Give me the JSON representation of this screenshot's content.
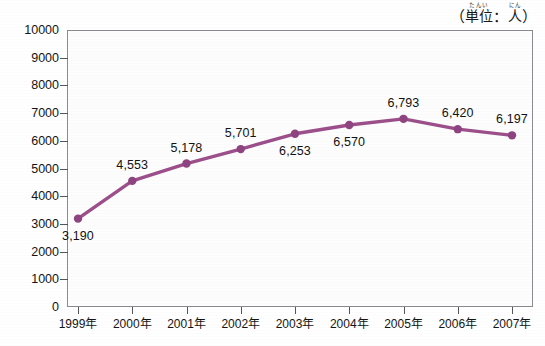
{
  "unit_label": {
    "open_paren": "（",
    "base_1": "単位",
    "ruby_1": "たんい",
    "separator": "：",
    "base_2": "人",
    "ruby_2": "にん",
    "close_paren": "）",
    "full_text": "（単位：人）"
  },
  "colors": {
    "line": "#9c4f8a",
    "marker": "#8e4480",
    "axis": "#55555c",
    "frame": "#8a8a90",
    "text": "#141414",
    "plot_background": "#fdfdfe"
  },
  "chart_data": {
    "type": "line",
    "title": "",
    "subtitle": "",
    "xlabel": "",
    "ylabel": "",
    "unit_note": "（単位：人）",
    "categories": [
      "1999年",
      "2000年",
      "2001年",
      "2002年",
      "2003年",
      "2004年",
      "2005年",
      "2006年",
      "2007年"
    ],
    "values": [
      3190,
      4553,
      5178,
      5701,
      6253,
      6570,
      6793,
      6420,
      6197
    ],
    "point_labels": [
      "3,190",
      "4,553",
      "5,178",
      "5,701",
      "6,253",
      "6,570",
      "6,793",
      "6,420",
      "6,197"
    ],
    "point_label_position": [
      "below",
      "above",
      "above",
      "above",
      "below",
      "below",
      "above",
      "above",
      "above"
    ],
    "ylim": [
      0,
      10000
    ],
    "ytick_values": [
      0,
      1000,
      2000,
      3000,
      4000,
      5000,
      6000,
      7000,
      8000,
      9000,
      10000
    ],
    "ytick_labels": [
      "0",
      "1000",
      "2000",
      "3000",
      "4000",
      "5000",
      "6000",
      "7000",
      "8000",
      "9000",
      "10000"
    ],
    "grid": false,
    "legend": null,
    "legend_position": "none",
    "series": [
      {
        "name": "",
        "values": [
          3190,
          4553,
          5178,
          5701,
          6253,
          6570,
          6793,
          6420,
          6197
        ]
      }
    ]
  }
}
